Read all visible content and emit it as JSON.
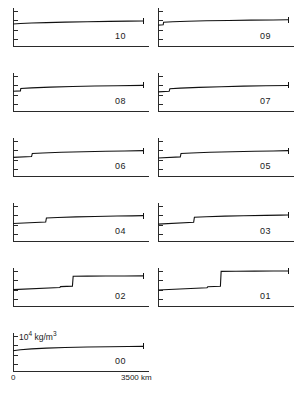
{
  "figure": {
    "units_label": "10",
    "units_exponent": "4",
    "units_rest": " kg/m",
    "units_rest_exponent": "3",
    "x_axis_start_label": "0",
    "x_axis_end_label": "3500 km",
    "x_min": 0,
    "x_max": 3500
  },
  "chart_data": {
    "type": "line",
    "title": "",
    "subtitle": "",
    "xlabel": "3500 km",
    "ylabel": "10^4 kg/m^3",
    "xlim": [
      0,
      3500
    ],
    "ylim": [
      0,
      1.35
    ],
    "grid": false,
    "legend": "none",
    "layout": "small-multiples, 2 columns x 5 rows plus 1 bottom-left panel",
    "panels": [
      {
        "label": "10",
        "row": 0,
        "col": 0,
        "discontinuity_x": null,
        "x": [
          0,
          200,
          500,
          900,
          1400,
          2000,
          2600,
          3100,
          3500
        ],
        "y": [
          0.78,
          0.8,
          0.815,
          0.832,
          0.848,
          0.862,
          0.874,
          0.882,
          0.888
        ]
      },
      {
        "label": "09",
        "row": 0,
        "col": 1,
        "discontinuity_x": 150,
        "x": [
          0,
          140,
          150,
          400,
          800,
          1300,
          1900,
          2500,
          3100,
          3500
        ],
        "y": [
          0.74,
          0.755,
          0.845,
          0.862,
          0.88,
          0.895,
          0.908,
          0.918,
          0.926,
          0.93
        ]
      },
      {
        "label": "08",
        "row": 1,
        "col": 0,
        "discontinuity_x": 210,
        "x": [
          0,
          200,
          210,
          500,
          1000,
          1600,
          2200,
          2800,
          3500
        ],
        "y": [
          0.7,
          0.715,
          0.8,
          0.822,
          0.848,
          0.87,
          0.886,
          0.898,
          0.91
        ]
      },
      {
        "label": "07",
        "row": 1,
        "col": 1,
        "discontinuity_x": 320,
        "x": [
          0,
          300,
          320,
          600,
          1100,
          1700,
          2300,
          2900,
          3500
        ],
        "y": [
          0.68,
          0.7,
          0.79,
          0.812,
          0.84,
          0.864,
          0.882,
          0.896,
          0.908
        ]
      },
      {
        "label": "06",
        "row": 2,
        "col": 0,
        "discontinuity_x": 520,
        "x": [
          0,
          500,
          520,
          800,
          1300,
          1900,
          2500,
          3000,
          3500
        ],
        "y": [
          0.66,
          0.69,
          0.8,
          0.818,
          0.842,
          0.862,
          0.878,
          0.89,
          0.9
        ]
      },
      {
        "label": "05",
        "row": 2,
        "col": 1,
        "discontinuity_x": 620,
        "x": [
          0,
          600,
          620,
          900,
          1400,
          2000,
          2600,
          3100,
          3500
        ],
        "y": [
          0.64,
          0.678,
          0.8,
          0.818,
          0.842,
          0.862,
          0.878,
          0.89,
          0.9
        ]
      },
      {
        "label": "04",
        "row": 3,
        "col": 0,
        "discontinuity_x": 900,
        "x": [
          0,
          880,
          900,
          1200,
          1700,
          2200,
          2800,
          3200,
          3500
        ],
        "y": [
          0.62,
          0.672,
          0.818,
          0.834,
          0.856,
          0.872,
          0.886,
          0.894,
          0.9
        ]
      },
      {
        "label": "03",
        "row": 3,
        "col": 1,
        "discontinuity_x": 980,
        "x": [
          0,
          960,
          980,
          1300,
          1800,
          2300,
          2900,
          3300,
          3500
        ],
        "y": [
          0.6,
          0.665,
          0.845,
          0.862,
          0.882,
          0.896,
          0.91,
          0.918,
          0.922
        ]
      },
      {
        "label": "02",
        "row": 4,
        "col": 0,
        "discontinuity_x": 1620,
        "secondary_discontinuity_x": 1280,
        "x": [
          0,
          1260,
          1280,
          1600,
          1620,
          2000,
          2500,
          3000,
          3500
        ],
        "y": [
          0.58,
          0.655,
          0.69,
          0.706,
          1.055,
          1.06,
          1.064,
          1.068,
          1.07
        ]
      },
      {
        "label": "01",
        "row": 4,
        "col": 1,
        "discontinuity_x": 1700,
        "secondary_discontinuity_x": 1340,
        "x": [
          0,
          1320,
          1340,
          1680,
          1700,
          2100,
          2600,
          3100,
          3500
        ],
        "y": [
          0.57,
          0.65,
          0.682,
          0.7,
          1.23,
          1.234,
          1.238,
          1.242,
          1.245
        ]
      },
      {
        "label": "00",
        "row": 5,
        "col": 0,
        "discontinuity_x": null,
        "x": [
          0,
          200,
          500,
          900,
          1400,
          2000,
          2600,
          3100,
          3500
        ],
        "y": [
          0.72,
          0.755,
          0.785,
          0.812,
          0.834,
          0.85,
          0.862,
          0.87,
          0.874
        ]
      }
    ]
  }
}
